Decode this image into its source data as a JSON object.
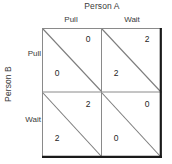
{
  "figure": {
    "type": "payoff-matrix",
    "column_player": "Person A",
    "row_player": "Person B",
    "column_strategies": [
      "Pull",
      "Wait"
    ],
    "row_strategies": [
      "Pull",
      "Wait"
    ],
    "cells": [
      {
        "row": "Pull",
        "column": "Pull",
        "upper_right_payoff": "0",
        "lower_left_payoff": "0"
      },
      {
        "row": "Pull",
        "column": "Wait",
        "upper_right_payoff": "2",
        "lower_left_payoff": "2"
      },
      {
        "row": "Wait",
        "column": "Pull",
        "upper_right_payoff": "2",
        "lower_left_payoff": "2"
      },
      {
        "row": "Wait",
        "column": "Wait",
        "upper_right_payoff": "0",
        "lower_left_payoff": "0"
      }
    ]
  },
  "colors": {
    "outline_light": "#8a8a8a",
    "outline_dark": "#1a1a1a",
    "diagonal": "#7d7d7d",
    "text": "#2b2b2b"
  }
}
